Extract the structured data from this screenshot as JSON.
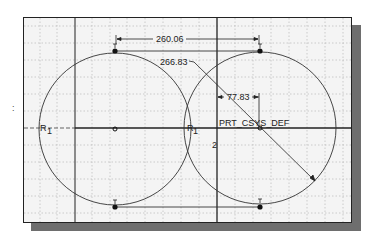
{
  "sketch": {
    "dimensions": {
      "horizontal_distance": "260.06",
      "radius": "266.83",
      "offset": "77.83"
    },
    "csys_label": "PRT_CSYS_DEF",
    "constraint_left": "R",
    "constraint_left_sub": "1",
    "constraint_mid": "R",
    "constraint_mid_sub": "1",
    "axis_marker": "2",
    "side_mark": ":"
  },
  "colors": {
    "panel_bg": "#f4f4f4",
    "grid": "#b8b8b8",
    "geometry": "#333333",
    "shadow": "#6e6e6e"
  }
}
